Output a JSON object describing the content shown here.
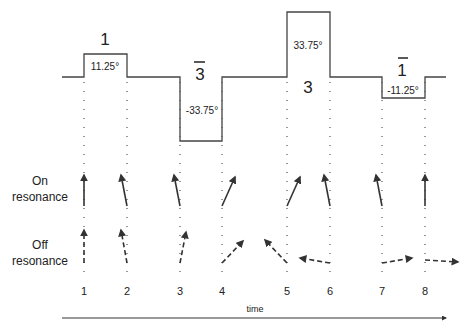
{
  "diagram": {
    "pulses": [
      {
        "symbol": "1",
        "overbar": false,
        "angle": "11.25°",
        "direction": "up",
        "relative_height": 1
      },
      {
        "symbol": "3",
        "overbar": true,
        "angle": "-33.75°",
        "direction": "down",
        "relative_height": 3
      },
      {
        "symbol": "3",
        "overbar": false,
        "angle": "33.75°",
        "direction": "up",
        "relative_height": 3
      },
      {
        "symbol": "1",
        "overbar": true,
        "angle": "-11.25°",
        "direction": "down",
        "relative_height": 1
      }
    ],
    "row_labels": {
      "on_resonance_line1": "On",
      "on_resonance_line2": "resonance",
      "off_resonance_line1": "Off",
      "off_resonance_line2": "resonance"
    },
    "time_points": [
      "1",
      "2",
      "3",
      "4",
      "5",
      "6",
      "7",
      "8"
    ],
    "time_axis_label": "time",
    "on_resonance_vectors": [
      "vertical",
      "tilted-left",
      "tilted-left",
      "tilted-right",
      "tilted-right",
      "tilted-left",
      "tilted-left",
      "vertical"
    ],
    "off_resonance_vectors": [
      "vertical",
      "tilted-left",
      "tilted-right",
      "tilted-right",
      "tilted-left",
      "left",
      "right",
      "right"
    ],
    "colors": {
      "line": "#444444",
      "arrow": "#333333",
      "dots": "#555555"
    }
  }
}
